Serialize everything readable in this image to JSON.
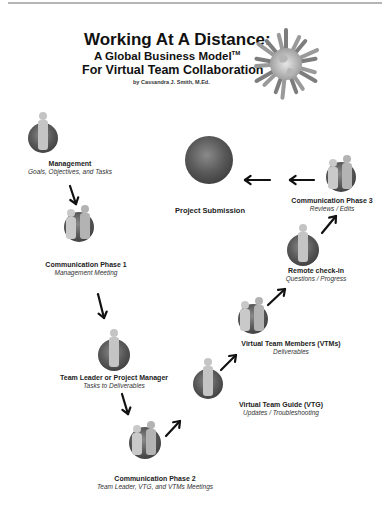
{
  "header": {
    "title": "Working At A Distance:",
    "subtitle": "A Global Business Model",
    "trademark": "TM",
    "subtitle2": "For Virtual Team Collaboration",
    "author": "by Cassandra J. Smith, M.Ed."
  },
  "nodes": [
    {
      "id": "management",
      "name": "Management",
      "sub": "Goals, Objectives, and Tasks",
      "people": 1
    },
    {
      "id": "comm-phase-1",
      "name": "Communication Phase 1",
      "sub": "Management Meeting",
      "people": 2
    },
    {
      "id": "team-leader",
      "name": "Team Leader or Project Manager",
      "sub": "Tasks to Deliverables",
      "people": 1
    },
    {
      "id": "comm-phase-2",
      "name": "Communication Phase 2",
      "sub": "Team Leader, VTG, and VTMs Meetings",
      "people": 2
    },
    {
      "id": "vtg",
      "name": "Virtual Team Guide (VTG)",
      "sub": "Updates / Troubleshooting",
      "people": 1
    },
    {
      "id": "vtms",
      "name": "Virtual Team Members (VTMs)",
      "sub": "Deliverables",
      "people": 2
    },
    {
      "id": "remote-check-in",
      "name": "Remote check-in",
      "sub": "Questions / Progress",
      "people": 1
    },
    {
      "id": "comm-phase-3",
      "name": "Communication Phase 3",
      "sub": "Reviews / Edits",
      "people": 2
    },
    {
      "id": "project-submission",
      "name": "Project Submission",
      "sub": "",
      "people": 0
    }
  ],
  "colors": {
    "globe_dark": "#2c2c2c",
    "globe_light": "#8a8a8a",
    "arrow": "#111111",
    "text": "#222222"
  }
}
